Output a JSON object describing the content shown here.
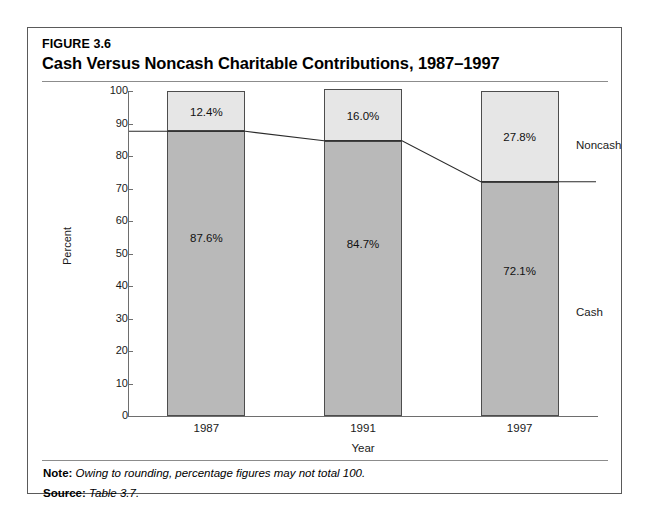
{
  "figure": {
    "number": "FIGURE 3.6",
    "title": "Cash Versus Noncash Charitable Contributions, 1987–1997"
  },
  "footnotes": {
    "note_label": "Note:",
    "note_text": "Owing to rounding, percentage figures may not total 100.",
    "source_label": "Source:",
    "source_text": "Table 3.7."
  },
  "series_labels": {
    "noncash": "Noncash",
    "cash": "Cash"
  },
  "colors": {
    "noncash_fill": "#e6e6e6",
    "cash_fill": "#b9b9b9",
    "segment_border": "#4d4d4d",
    "axis": "#6e6e6e",
    "rule": "#8c8c8c",
    "frame": "#5a5a5a"
  },
  "chart_data": {
    "type": "bar",
    "subtype": "stacked-100-percent",
    "title": "Cash Versus Noncash Charitable Contributions, 1987–1997",
    "xlabel": "Year",
    "ylabel": "Percent",
    "categories": [
      "1987",
      "1991",
      "1997"
    ],
    "ylim": [
      0,
      100
    ],
    "yticks": [
      0,
      10,
      20,
      30,
      40,
      50,
      60,
      70,
      80,
      90,
      100
    ],
    "ytick_labels": [
      "0",
      "10",
      "20",
      "30",
      "40",
      "50",
      "60",
      "70",
      "80",
      "90",
      "100"
    ],
    "grid": false,
    "legend_position": "right-of-plot-inline",
    "series": [
      {
        "name": "Noncash",
        "values": [
          12.4,
          16.0,
          27.8
        ],
        "data_labels": [
          "12.4%",
          "16.0%",
          "27.8%"
        ]
      },
      {
        "name": "Cash",
        "values": [
          87.6,
          84.7,
          72.1
        ],
        "data_labels": [
          "87.6%",
          "84.7%",
          "72.1%"
        ]
      }
    ],
    "annotations": [
      "Connector line joins the cash/noncash boundary of each bar"
    ]
  }
}
